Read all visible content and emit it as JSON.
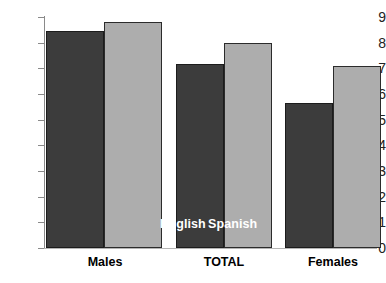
{
  "chart_data": {
    "type": "bar",
    "title": "",
    "subtitle": "",
    "xlabel": "",
    "ylabel": "",
    "categories": [
      "Males",
      "TOTAL",
      "Females"
    ],
    "series": [
      {
        "name": "English",
        "color": "#3c3c3c",
        "values": [
          8.45,
          7.15,
          5.65
        ]
      },
      {
        "name": "Spanish",
        "color": "#adadad",
        "values": [
          8.8,
          8.0,
          7.1
        ]
      }
    ],
    "ylim": [
      0,
      9
    ],
    "ytick_values": [
      0,
      1,
      2,
      3,
      4,
      5,
      6,
      7,
      8,
      9
    ],
    "ytick_labels": [
      "0",
      "1",
      "2",
      "3",
      "4",
      "5",
      "6",
      "7",
      "8",
      "9"
    ],
    "grid": false,
    "legend": {
      "position": "overlay-on-total-bars",
      "entries": [
        "English",
        "Spanish"
      ],
      "text_color": "#ffffff"
    },
    "axis_color": "#8a8a8a",
    "background": "#ffffff"
  },
  "axis": {
    "y_labels": [
      "9",
      "8",
      "7",
      "6",
      "5",
      "4",
      "3",
      "2",
      "1",
      "0"
    ]
  },
  "legend": {
    "english": "English",
    "spanish": "Spanish"
  },
  "categories": {
    "males": "Males",
    "total": "TOTAL",
    "females": "Females"
  }
}
